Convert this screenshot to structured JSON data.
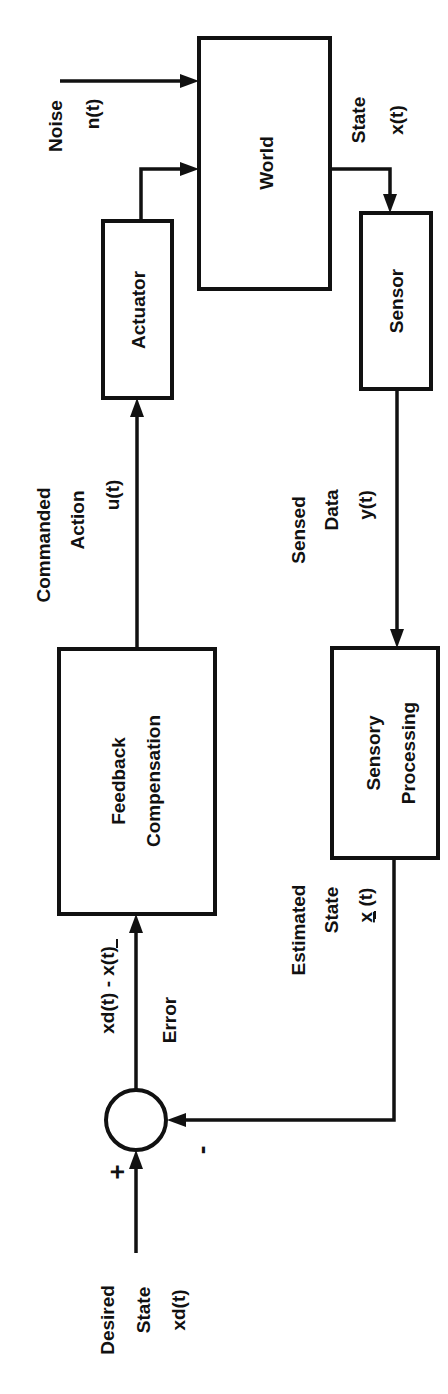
{
  "diagram": {
    "orientation": "rotated 90 degrees counterclockwise",
    "blocks": {
      "world": {
        "label": "World"
      },
      "actuator": {
        "label": "Actuator"
      },
      "sensor": {
        "label": "Sensor"
      },
      "feedback": {
        "line1": "Feedback",
        "line2": "Compensation"
      },
      "sensory": {
        "line1": "Sensory",
        "line2": "Processing"
      }
    },
    "signals": {
      "noise": {
        "line1": "Noise",
        "line2": "n(t)"
      },
      "state": {
        "line1": "State",
        "line2": "x(t)"
      },
      "commanded": {
        "line1": "Commanded",
        "line2": "Action",
        "line3": "u(t)"
      },
      "sensed": {
        "line1": "Sensed",
        "line2": "Data",
        "line3": "y(t)"
      },
      "estimated": {
        "line1": "Estimated",
        "line2": "State",
        "line3_x": "x",
        "line3_t": " (t)"
      },
      "error": {
        "expr_a": "xd(t) - ",
        "expr_b": "x",
        "expr_c": "(t)",
        "label": "Error"
      },
      "desired": {
        "line1": "Desired",
        "line2": "State",
        "line3": "xd(t)"
      }
    },
    "summing_junction": {
      "plus": "+",
      "minus": "-"
    },
    "colors": {
      "stroke": "#111111",
      "background": "#ffffff"
    }
  }
}
